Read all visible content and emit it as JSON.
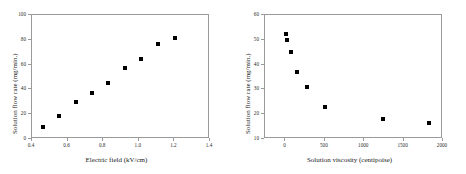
{
  "figure": {
    "background": "#ffffff",
    "frame_color": "#9a9a9a",
    "marker_color": "#000000"
  },
  "chart_data": [
    {
      "type": "scatter",
      "title": "",
      "xlabel": "Electric field (kV/cm)",
      "ylabel": "Solution flow rate (mg/min.)",
      "xlim": [
        0.4,
        1.4
      ],
      "ylim": [
        0,
        100
      ],
      "xticks": [
        0.4,
        0.6,
        0.8,
        1.0,
        1.2,
        1.4
      ],
      "xticklabels": [
        "0.4",
        "0.6",
        "0.8",
        "1.0",
        "1.2",
        "1.4"
      ],
      "yticks": [
        0,
        20,
        40,
        60,
        80,
        100
      ],
      "yticklabels": [
        "0",
        "20",
        "40",
        "60",
        "80",
        "100"
      ],
      "grid": false,
      "legend": false,
      "marker": "filled-square",
      "x": [
        0.47,
        0.555,
        0.65,
        0.745,
        0.835,
        0.93,
        1.02,
        1.115,
        1.21
      ],
      "y": [
        9,
        17.5,
        29,
        36.5,
        44,
        56.5,
        64,
        76,
        81
      ]
    },
    {
      "type": "scatter",
      "title": "",
      "xlabel": "Solution viscosity (centipoise)",
      "ylabel": "Solution flow rate (mg/min.)",
      "xlim": [
        -260,
        2000
      ],
      "ylim": [
        10,
        60
      ],
      "xticks": [
        0,
        500,
        1000,
        1500,
        2000
      ],
      "xticklabels": [
        "0",
        "500",
        "1000",
        "1500",
        "2000"
      ],
      "yticks": [
        10,
        20,
        30,
        40,
        50,
        60
      ],
      "yticklabels": [
        "10",
        "20",
        "30",
        "40",
        "50",
        "60"
      ],
      "grid": false,
      "legend": false,
      "marker": "filled-square",
      "x": [
        20,
        30,
        85,
        160,
        280,
        520,
        1250,
        1830
      ],
      "y": [
        52,
        49.5,
        44.5,
        36.5,
        30.5,
        22.5,
        17.5,
        16
      ]
    }
  ]
}
